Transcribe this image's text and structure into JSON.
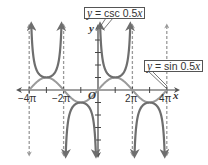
{
  "chart_data": {
    "type": "line",
    "title": "",
    "xlabel": "x",
    "ylabel": "y",
    "origin_label": "O",
    "xlim": [
      -14.5,
      14.5
    ],
    "ylim": [
      -5.2,
      5.2
    ],
    "x_ticks": [
      {
        "value": -12.566,
        "label": "−4π"
      },
      {
        "value": -6.283,
        "label": "−2π"
      },
      {
        "value": 6.283,
        "label": "2π"
      },
      {
        "value": 12.566,
        "label": "4π"
      }
    ],
    "x_minor_tick_step": "π",
    "y_tick_step": 1,
    "grid": false,
    "asymptotes": {
      "x": [
        -12.566,
        -6.283,
        6.283,
        12.566
      ],
      "style": "dashed"
    },
    "series": [
      {
        "name": "y = csc 0.5x",
        "function": "csc(0.5*x)",
        "color": "#6e6e6e",
        "asymptotes_at": [
          "-4π",
          "-2π",
          "0",
          "2π",
          "4π"
        ]
      },
      {
        "name": "y = sin 0.5x",
        "function": "sin(0.5*x)",
        "color": "#9a9a9a",
        "period": "4π",
        "amplitude": 1
      }
    ],
    "annotations": [
      {
        "text": "y = csc 0.5x",
        "points_to": "csc branch near y-axis"
      },
      {
        "text": "y = sin 0.5x",
        "points_to": "sin curve at 4π"
      }
    ]
  },
  "labels": {
    "csc_prefix": "y",
    "csc_rest": " = csc 0.5",
    "csc_x": "x",
    "sin_prefix": "y",
    "sin_rest": " = sin 0.5",
    "sin_x": "x",
    "x_axis": "x",
    "y_axis": "y",
    "origin": "O",
    "tick_neg4pi": "−4π",
    "tick_neg2pi": "−2π",
    "tick_2pi": "2π",
    "tick_4pi": "4π"
  }
}
